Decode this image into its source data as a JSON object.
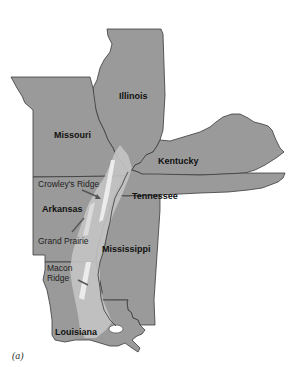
{
  "map": {
    "states": [
      {
        "id": "illinois",
        "label": "Illinois"
      },
      {
        "id": "missouri",
        "label": "Missouri"
      },
      {
        "id": "kentucky",
        "label": "Kentucky"
      },
      {
        "id": "tennessee",
        "label": "Tennessee"
      },
      {
        "id": "arkansas",
        "label": "Arkansas"
      },
      {
        "id": "mississippi",
        "label": "Mississippi"
      },
      {
        "id": "louisiana",
        "label": "Louisiana"
      }
    ],
    "regions": [
      {
        "id": "crowleys-ridge",
        "label": "Crowley's Ridge"
      },
      {
        "id": "grand-prairie",
        "label": "Grand Prairie"
      },
      {
        "id": "macon-ridge-line1",
        "label": "Macon"
      },
      {
        "id": "macon-ridge-line2",
        "label": "Ridge"
      }
    ],
    "caption": "(a)",
    "colors": {
      "state_fill": "#9a9a9a",
      "lowland_fill": "#c4c4c4",
      "ridge_highlight": "#ececec",
      "border": "#3a3a3a"
    }
  }
}
